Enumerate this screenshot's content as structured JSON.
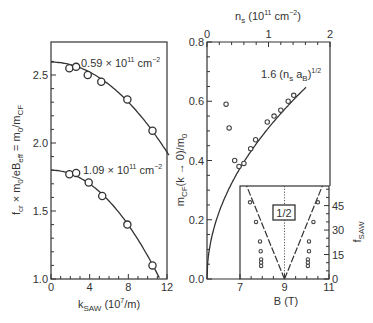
{
  "chart_data": [
    {
      "type": "scatter",
      "panel": "left",
      "xlabel": "k_SAW (10^7/m)",
      "xlabel_main": "k",
      "xlabel_sub": "SAW",
      "xlabel_rest": " (10",
      "xlabel_sup": "7",
      "xlabel_end": "/m)",
      "ylabel": "f_cr × m0/eB_eff = m0/m_CF",
      "xlim": [
        0,
        12
      ],
      "ylim": [
        1.0,
        2.7
      ],
      "xticks": [
        0,
        4,
        8,
        12
      ],
      "xtick_labels": [
        "0",
        "4",
        "8",
        "12"
      ],
      "yticks": [
        1.0,
        1.5,
        2.0,
        2.5
      ],
      "ytick_labels": [
        "1.0",
        "1.5",
        "2.0",
        "2.5"
      ],
      "series": [
        {
          "name": "0.59 × 10^11 cm^-2",
          "label_main": "0.59 × 10",
          "label_sup": "11",
          "label_unit": " cm",
          "label_unit_sup": "−2",
          "x": [
            1.9,
            2.6,
            3.8,
            5.2,
            7.9,
            10.5
          ],
          "y": [
            2.55,
            2.56,
            2.5,
            2.45,
            2.32,
            2.09
          ],
          "fit_y0": 2.595,
          "fit_curvature": 0.0046
        },
        {
          "name": "1.09 × 10^11 cm^-2",
          "label_main": "1.09 × 10",
          "label_sup": "11",
          "label_unit": " cm",
          "label_unit_sup": "−2",
          "x": [
            1.9,
            2.6,
            3.9,
            5.3,
            7.9,
            10.5
          ],
          "y": [
            1.77,
            1.78,
            1.71,
            1.61,
            1.4,
            1.1
          ],
          "fit_y0": 1.8,
          "fit_curvature": 0.0063
        }
      ]
    },
    {
      "type": "scatter",
      "panel": "right",
      "xlabel": "n_s (10^11 cm^-2)",
      "ylabel": "m_CF(k → 0)/m0",
      "xlim": [
        0,
        2
      ],
      "ylim": [
        0.0,
        0.8
      ],
      "xticks": [
        0,
        1,
        2
      ],
      "xtick_labels": [
        "0",
        "1",
        "2"
      ],
      "yticks": [
        0.0,
        0.2,
        0.4,
        0.6,
        0.8
      ],
      "ytick_labels": [
        "0.0",
        "0.2",
        "0.4",
        "0.6",
        "0.8"
      ],
      "fit_label": "1.6 (n_s a_B)^1/2",
      "fit_coefficient": 0.51,
      "x": [
        0.31,
        0.36,
        0.45,
        0.52,
        0.6,
        0.71,
        0.79,
        0.98,
        1.09,
        1.2,
        1.32,
        1.41
      ],
      "y": [
        0.59,
        0.51,
        0.4,
        0.38,
        0.39,
        0.44,
        0.47,
        0.53,
        0.55,
        0.57,
        0.6,
        0.62
      ]
    },
    {
      "type": "scatter",
      "panel": "inset",
      "xlabel": "B (T)",
      "ylabel": "f_SAW",
      "xlim": [
        7,
        11
      ],
      "ylim": [
        0,
        57
      ],
      "xticks": [
        7,
        9,
        11
      ],
      "xtick_labels": [
        "7",
        "9",
        "11"
      ],
      "yticks": [
        0,
        15,
        30,
        45
      ],
      "ytick_labels": [
        "0",
        "15",
        "30",
        "45"
      ],
      "annotation": "1/2",
      "center_B": 9,
      "dashed_lines": [
        {
          "from": [
            9,
            0
          ],
          "to": [
            7.3,
            57
          ]
        },
        {
          "from": [
            9,
            0
          ],
          "to": [
            10.7,
            57
          ]
        }
      ],
      "x": [
        7.45,
        7.72,
        7.9,
        7.93,
        7.95,
        7.95,
        7.95,
        10.5,
        10.3,
        10.1,
        10.1,
        10.05,
        10.05,
        10.05
      ],
      "y": [
        47,
        35,
        23,
        17,
        12,
        10,
        8,
        47,
        35,
        23,
        17,
        12,
        10,
        8
      ]
    }
  ]
}
